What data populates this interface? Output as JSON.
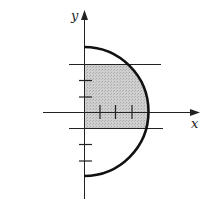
{
  "figure": {
    "type": "semicircle-region",
    "axes": {
      "x_label": "x",
      "y_label": "y",
      "tick_spacing_units": 1,
      "x_ticks": [
        1,
        2,
        3
      ],
      "y_ticks": [
        -3,
        -2,
        -1,
        1,
        2,
        3
      ]
    },
    "curve": {
      "shape": "right semicircle",
      "radius_units": 4,
      "center": [
        0,
        0
      ]
    },
    "horizontal_lines": [
      {
        "y": 3
      },
      {
        "y": -1
      }
    ],
    "shaded_region": {
      "y_from": -1,
      "y_to": 3,
      "x_from": 0,
      "bounded_by": "semicircle",
      "color": "#c8c8c8"
    },
    "colors": {
      "stroke": "#111111",
      "shade": "#c8c8c8"
    }
  }
}
